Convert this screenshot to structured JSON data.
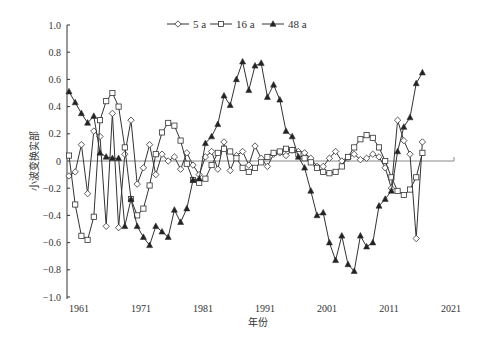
{
  "chart_data": {
    "type": "line",
    "title": "",
    "xlabel": "年份",
    "ylabel": "小波变换实部",
    "ylim": [
      -1.0,
      1.0
    ],
    "yticks": [
      "1.0",
      "0.8",
      "0.6",
      "0.4",
      "0.2",
      "0",
      "-0.2",
      "-0.4",
      "-0.6",
      "-0.8",
      "-1.0"
    ],
    "xticks": [
      "1961",
      "1971",
      "1981",
      "1991",
      "2001",
      "2011",
      "2021"
    ],
    "legend": [
      "5 a",
      "16 a",
      "48 a"
    ],
    "legend_position": "top",
    "grid": false,
    "x": [
      1961,
      1962,
      1963,
      1964,
      1965,
      1966,
      1967,
      1968,
      1969,
      1970,
      1971,
      1972,
      1973,
      1974,
      1975,
      1976,
      1977,
      1978,
      1979,
      1980,
      1981,
      1982,
      1983,
      1984,
      1985,
      1986,
      1987,
      1988,
      1989,
      1990,
      1991,
      1992,
      1993,
      1994,
      1995,
      1996,
      1997,
      1998,
      1999,
      2000,
      2001,
      2002,
      2003,
      2004,
      2005,
      2006,
      2007,
      2008,
      2009,
      2010,
      2011,
      2012,
      2013,
      2014,
      2015,
      2016,
      2017,
      2018
    ],
    "series": [
      {
        "name": "5 a",
        "marker": "diamond",
        "values": [
          -0.11,
          -0.08,
          0.12,
          -0.24,
          0.22,
          0.18,
          -0.48,
          0.35,
          -0.49,
          0.05,
          0.3,
          -0.17,
          -0.05,
          0.12,
          -0.1,
          0.05,
          0.0,
          0.03,
          -0.06,
          0.06,
          -0.03,
          -0.1,
          0.03,
          0.07,
          -0.06,
          0.14,
          -0.07,
          0.04,
          0.07,
          -0.03,
          0.11,
          0.02,
          -0.04,
          0.05,
          0.06,
          0.04,
          0.08,
          0.07,
          0.06,
          0.02,
          -0.04,
          -0.04,
          0.02,
          0.07,
          0.0,
          0.02,
          0.05,
          0.01,
          0.02,
          0.05,
          0.03,
          -0.05,
          -0.2,
          0.3,
          0.15,
          0.05,
          -0.57,
          0.14
        ]
      },
      {
        "name": "16 a",
        "marker": "square",
        "values": [
          0.04,
          -0.32,
          -0.55,
          -0.58,
          -0.41,
          0.3,
          0.44,
          0.5,
          0.4,
          0.1,
          -0.28,
          -0.4,
          -0.35,
          -0.18,
          0.05,
          0.21,
          0.28,
          0.26,
          0.15,
          -0.02,
          -0.14,
          -0.16,
          -0.13,
          -0.03,
          0.06,
          0.09,
          0.07,
          0.02,
          -0.05,
          -0.08,
          -0.05,
          -0.01,
          0.03,
          0.06,
          0.07,
          0.09,
          0.08,
          0.05,
          0.02,
          -0.01,
          -0.05,
          -0.08,
          -0.09,
          -0.08,
          -0.04,
          0.03,
          0.1,
          0.16,
          0.19,
          0.17,
          0.1,
          0.0,
          -0.12,
          -0.22,
          -0.25,
          -0.21,
          -0.12,
          0.06
        ]
      },
      {
        "name": "48 a",
        "marker": "triangle",
        "values": [
          0.51,
          0.43,
          0.35,
          0.28,
          0.33,
          0.06,
          0.03,
          0.02,
          0.02,
          -0.48,
          -0.28,
          -0.48,
          -0.56,
          -0.62,
          -0.48,
          -0.52,
          -0.56,
          -0.36,
          -0.45,
          -0.35,
          -0.14,
          -0.13,
          0.13,
          0.18,
          0.27,
          0.48,
          0.41,
          0.6,
          0.73,
          0.52,
          0.7,
          0.72,
          0.47,
          0.56,
          0.45,
          0.22,
          0.18,
          0.03,
          -0.05,
          -0.22,
          -0.4,
          -0.38,
          -0.6,
          -0.73,
          -0.55,
          -0.76,
          -0.81,
          -0.55,
          -0.63,
          -0.6,
          -0.33,
          -0.28,
          -0.22,
          0.07,
          0.25,
          0.32,
          0.57,
          0.65
        ]
      }
    ]
  }
}
